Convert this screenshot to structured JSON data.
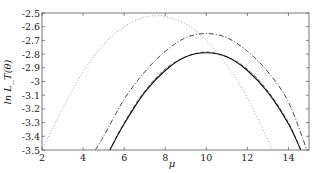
{
  "chart_data": {
    "type": "line",
    "title": "",
    "xlabel": "μ",
    "ylabel": "ln L_T(θ)",
    "xlim": [
      2,
      15
    ],
    "ylim": [
      -3.5,
      -2.5
    ],
    "xticks": [
      2,
      4,
      6,
      8,
      10,
      12,
      14
    ],
    "xtick_labels": [
      "2",
      "4",
      "6",
      "8",
      "10",
      "12",
      "14"
    ],
    "yticks": [
      -2.5,
      -2.6,
      -2.7,
      -2.8,
      -2.9,
      -3.0,
      -3.1,
      -3.2,
      -3.3,
      -3.4,
      -3.5
    ],
    "ytick_labels": [
      "-2.5",
      "-2.6",
      "-2.7",
      "-2.8",
      "-2.9",
      "-3",
      "-3.1",
      "-3.2",
      "-3.3",
      "-3.4",
      "-3.5"
    ],
    "grid": false,
    "legend": null,
    "series": [
      {
        "name": "dotted",
        "style": "dotted",
        "color": "#9a9a9a",
        "peak": [
          7.6,
          -2.52
        ],
        "x": [
          2.0,
          3.0,
          4.0,
          5.0,
          6.0,
          7.0,
          7.6,
          8.0,
          9.0,
          10.0,
          11.0,
          12.0,
          13.0,
          13.2
        ],
        "y": [
          -3.5,
          -3.2,
          -2.93,
          -2.73,
          -2.6,
          -2.53,
          -2.52,
          -2.525,
          -2.58,
          -2.7,
          -2.88,
          -3.12,
          -3.43,
          -3.5
        ]
      },
      {
        "name": "dash-dot",
        "style": "dashdot",
        "color": "#333333",
        "peak": [
          10.0,
          -2.65
        ],
        "x": [
          4.6,
          5.0,
          6.0,
          7.0,
          8.0,
          9.0,
          10.0,
          11.0,
          12.0,
          13.0,
          14.0,
          14.9
        ],
        "y": [
          -3.5,
          -3.4,
          -3.13,
          -2.93,
          -2.78,
          -2.68,
          -2.65,
          -2.68,
          -2.78,
          -2.93,
          -3.15,
          -3.5
        ]
      },
      {
        "name": "dashed",
        "style": "dashed",
        "color": "#555555",
        "peak": [
          10.0,
          -2.785
        ],
        "x": [
          5.3,
          6.0,
          7.0,
          8.0,
          9.0,
          10.0,
          11.0,
          12.0,
          13.0,
          14.0,
          14.6
        ],
        "y": [
          -3.5,
          -3.3,
          -3.07,
          -2.91,
          -2.82,
          -2.785,
          -2.82,
          -2.91,
          -3.07,
          -3.3,
          -3.5
        ]
      },
      {
        "name": "solid",
        "style": "solid",
        "color": "#111111",
        "peak": [
          10.0,
          -2.79
        ],
        "x": [
          5.3,
          6.0,
          7.0,
          8.0,
          9.0,
          10.0,
          11.0,
          12.0,
          13.0,
          14.0,
          14.6
        ],
        "y": [
          -3.5,
          -3.31,
          -3.08,
          -2.92,
          -2.82,
          -2.79,
          -2.82,
          -2.92,
          -3.08,
          -3.31,
          -3.5
        ]
      }
    ]
  }
}
